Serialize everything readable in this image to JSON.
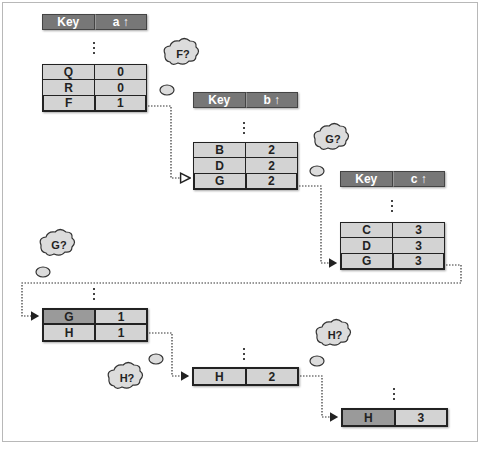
{
  "tables": [
    {
      "id": "a",
      "header": {
        "key": "Key",
        "col": "a"
      },
      "rows": [
        {
          "key": "Q",
          "value": "0"
        },
        {
          "key": "R",
          "value": "0"
        },
        {
          "key": "F",
          "value": "1",
          "highlight": true
        }
      ]
    },
    {
      "id": "b",
      "header": {
        "key": "Key",
        "col": "b"
      },
      "rows": [
        {
          "key": "B",
          "value": "2"
        },
        {
          "key": "D",
          "value": "2"
        },
        {
          "key": "G",
          "value": "2",
          "highlight": true
        }
      ]
    },
    {
      "id": "c",
      "header": {
        "key": "Key",
        "col": "c"
      },
      "rows": [
        {
          "key": "C",
          "value": "3"
        },
        {
          "key": "D",
          "value": "3"
        },
        {
          "key": "G",
          "value": "3",
          "highlight": true
        }
      ]
    },
    {
      "id": "result1",
      "rows": [
        {
          "key": "G",
          "value": "1",
          "key_dark": true
        },
        {
          "key": "H",
          "value": "1"
        }
      ]
    },
    {
      "id": "result2",
      "rows": [
        {
          "key": "H",
          "value": "2"
        }
      ]
    },
    {
      "id": "result3",
      "rows": [
        {
          "key": "H",
          "value": "3",
          "key_dark": true
        }
      ]
    }
  ],
  "clouds": [
    {
      "label": "F?"
    },
    {
      "label": "G?"
    },
    {
      "label": "G?"
    },
    {
      "label": "H?"
    },
    {
      "label": "H?"
    }
  ],
  "sort_arrow": "↑",
  "colors": {
    "header_bg": "#777777",
    "cell_bg": "#d3d3d3",
    "cell_dark": "#9a9a9a",
    "border": "#222222"
  }
}
